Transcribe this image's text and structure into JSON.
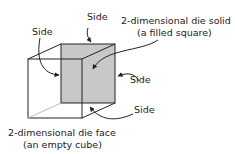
{
  "diagram": {
    "type": "labeled-cube",
    "labels": {
      "side_top": "Side",
      "side_left": "Side",
      "solid_line1": "2-dimensional die solid",
      "solid_line2": "(a filled square)",
      "side_right": "Side",
      "side_bottom_right": "Side",
      "face_line1": "2-dimensional die face",
      "face_line2": "(an empty cube)"
    },
    "colors": {
      "stroke": "#222222",
      "fill": "#c8c8c8"
    }
  }
}
